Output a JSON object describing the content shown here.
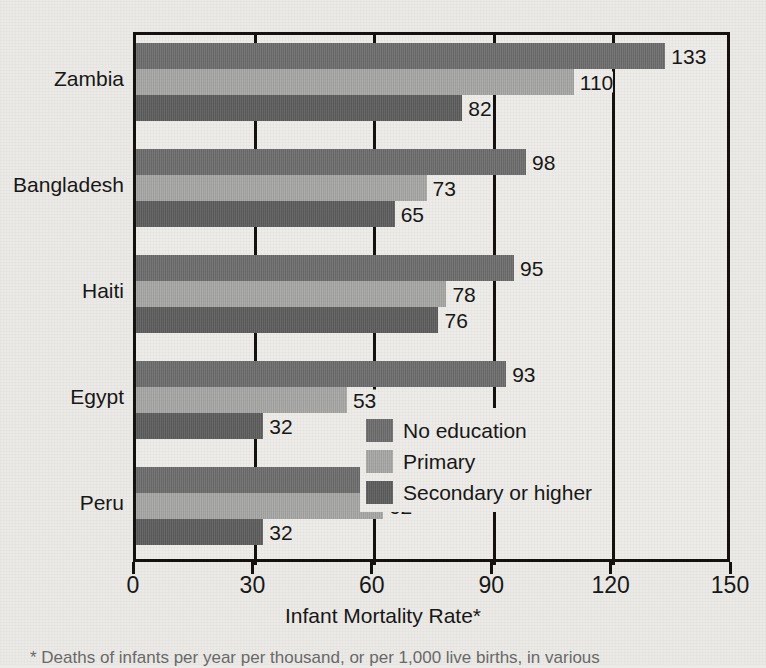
{
  "chart_data": {
    "type": "bar",
    "orientation": "horizontal",
    "title": "",
    "xlabel": "Infant Mortality Rate*",
    "ylabel": "",
    "xlim": [
      0,
      150
    ],
    "xticks": [
      0,
      30,
      60,
      90,
      120,
      150
    ],
    "xtick_labels": [
      "0",
      "30",
      "60",
      "90",
      "120",
      "150"
    ],
    "grid": true,
    "legend_position": "inside lower-right",
    "categories": [
      "Zambia",
      "Bangladesh",
      "Haiti",
      "Egypt",
      "Peru"
    ],
    "series": [
      {
        "name": "No education",
        "color": "#6e6e6e",
        "values": [
          133,
          98,
          95,
          93,
          79
        ]
      },
      {
        "name": "Primary",
        "color": "#a8a8a6",
        "values": [
          110,
          73,
          78,
          53,
          62
        ]
      },
      {
        "name": "Secondary or higher",
        "color": "#5e5e5e",
        "values": [
          82,
          65,
          76,
          32,
          32
        ]
      }
    ],
    "data_labels": [
      [
        "133",
        "110",
        "82"
      ],
      [
        "98",
        "73",
        "65"
      ],
      [
        "95",
        "78",
        "76"
      ],
      [
        "93",
        "53",
        "32"
      ],
      [
        "79",
        "62",
        "32"
      ]
    ]
  },
  "axis": {
    "x_title": "Infant Mortality Rate*",
    "tick_labels": [
      "0",
      "30",
      "60",
      "90",
      "120",
      "150"
    ]
  },
  "legend": {
    "items": [
      {
        "label": "No education"
      },
      {
        "label": "Primary"
      },
      {
        "label": "Secondary or higher"
      }
    ]
  },
  "footnote": {
    "text": "* Deaths of infants per year per thousand, or per 1,000 live births, in various"
  }
}
